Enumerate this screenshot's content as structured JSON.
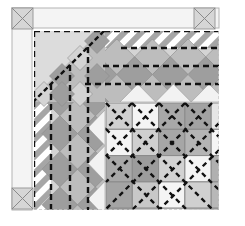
{
  "diagram": {
    "type": "quilt-corner-layout",
    "colors": {
      "background": "#ffffff",
      "border_fill": "#f4f4f4",
      "border_stroke": "#b4b4b4",
      "corner_fill": "#d6d6d6",
      "triangle_fill": "#dcdcdc",
      "diamond_dark": "#9e9e9e",
      "diamond_mid": "#bdbdbd",
      "diamond_light": "#d4d4d4",
      "setting_white": "#f2f2f2",
      "stripe_dark": "#a6a6a6",
      "stripe_light": "#ffffff",
      "seam_dash": "#111111",
      "grid_line": "#8a8a8a",
      "edge_dash": "#c8c8c8"
    },
    "outer_border": {
      "x": 12,
      "y": 8,
      "right": 219,
      "bottom": 210,
      "width": 20
    },
    "corner_blocks": [
      {
        "name": "corner-block-top-left",
        "x": 12,
        "y": 8,
        "size": 21
      },
      {
        "name": "corner-block-top-right",
        "x": 194,
        "y": 8,
        "size": 21
      },
      {
        "name": "corner-block-bottom-left",
        "x": 12,
        "y": 188,
        "size": 21
      }
    ],
    "inner_area": {
      "x": 34,
      "y": 31,
      "right": 219,
      "bottom": 210
    },
    "band": {
      "rows": [
        31,
        48,
        66,
        84,
        102
      ],
      "cols": [
        34,
        51,
        70,
        88,
        105
      ]
    },
    "center_grid": {
      "x0": 106,
      "y0": 103,
      "cell": 26.3,
      "cols": 5,
      "rows": 4,
      "shades": [
        [
          "#d0d0d0",
          "#f4f4f4",
          "#a8a8a8",
          "#a2a2a2",
          "#e6e6e6"
        ],
        [
          "#f4f4f4",
          "#cfcfcf",
          "#a6a6a6",
          "#b4b4b4",
          "#f4f4f4"
        ],
        [
          "#a8a8a8",
          "#9c9c9c",
          "#d2d2d2",
          "#f4f4f4",
          "#b0b0b0"
        ],
        [
          "#a4a4a4",
          "#c8c8c8",
          "#f4f4f4",
          "#d0d0d0",
          "#b8b8b8"
        ]
      ]
    }
  }
}
